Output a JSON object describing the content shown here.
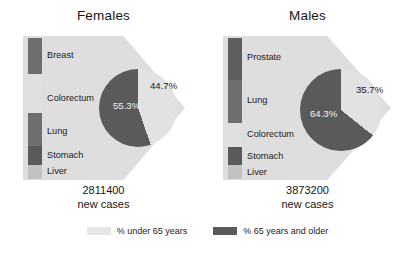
{
  "figure": {
    "background": "#ffffff",
    "colors": {
      "under65": "#e2e2e2",
      "over65": "#5a5a5a",
      "backdrop": "#dedede",
      "bar_dark": "#6b6b6b",
      "bar_darker": "#5a5a5a",
      "bar_light": "#e2e2e2",
      "bar_mid_light": "#c9c9c9"
    }
  },
  "legend": {
    "items": [
      {
        "label": "% under 65 years",
        "color": "#e6e6e6",
        "swatch_name": "legend-swatch-under-65"
      },
      {
        "label": "% 65 years and older",
        "color": "#5a5a5a",
        "swatch_name": "legend-swatch-over-65"
      }
    ]
  },
  "panels": [
    {
      "title": "Females",
      "cases_number": "2811400",
      "cases_caption": "new cases",
      "sites": [
        {
          "label": "Breast",
          "color": "#6e6e6e",
          "height_pct": 25.5,
          "label_top": 50
        },
        {
          "label": "Colorectum",
          "color": "#e0e0e0",
          "height_pct": 28.0,
          "label_top": 93
        },
        {
          "label": "Lung",
          "color": "#6e6e6e",
          "height_pct": 23.0,
          "label_top": 126
        },
        {
          "label": "Stomach",
          "color": "#5a5a5a",
          "height_pct": 13.5,
          "label_top": 150
        },
        {
          "label": "Liver",
          "color": "#c2c2c2",
          "height_pct": 10.0,
          "label_top": 166
        }
      ],
      "pie": {
        "under65_pct": 44.7,
        "over65_pct": 55.3,
        "under65_label": "44.7%",
        "over65_label": "55.3%",
        "cx": 138,
        "cy": 108,
        "r": 39
      }
    },
    {
      "title": "Males",
      "cases_number": "3873200",
      "cases_caption": "new cases",
      "sites": [
        {
          "label": "Prostate",
          "color": "#5e5e5e",
          "height_pct": 30.0,
          "label_top": 52
        },
        {
          "label": "Lung",
          "color": "#6e6e6e",
          "height_pct": 30.0,
          "label_top": 95
        },
        {
          "label": "Colorectum",
          "color": "#e0e0e0",
          "height_pct": 17.0,
          "label_top": 129
        },
        {
          "label": "Stomach",
          "color": "#5a5a5a",
          "height_pct": 13.0,
          "label_top": 151
        },
        {
          "label": "Liver",
          "color": "#c2c2c2",
          "height_pct": 10.0,
          "label_top": 167
        }
      ],
      "pie": {
        "under65_pct": 35.7,
        "over65_pct": 64.3,
        "under65_label": "35.7%",
        "over65_label": "64.3%",
        "cx": 137,
        "cy": 110,
        "r": 41
      }
    }
  ],
  "chart_data": {
    "type": "pie",
    "charts": [
      {
        "name": "Females",
        "total_new_cases": 2811400,
        "labels": [
          "% under 65 years",
          "% 65 years and older"
        ],
        "values": [
          44.7,
          55.3
        ],
        "colors": [
          "#e2e2e2",
          "#5a5a5a"
        ],
        "leading_sites": [
          "Breast",
          "Colorectum",
          "Lung",
          "Stomach",
          "Liver"
        ]
      },
      {
        "name": "Males",
        "total_new_cases": 3873200,
        "labels": [
          "% under 65 years",
          "% 65 years and older"
        ],
        "values": [
          35.7,
          64.3
        ],
        "colors": [
          "#e2e2e2",
          "#5a5a5a"
        ],
        "leading_sites": [
          "Prostate",
          "Lung",
          "Colorectum",
          "Stomach",
          "Liver"
        ]
      }
    ],
    "legend_position": "bottom",
    "grid": false
  }
}
